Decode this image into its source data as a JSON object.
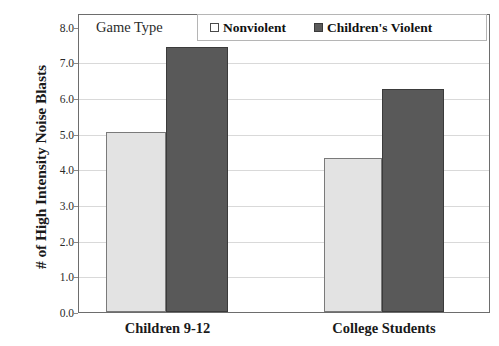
{
  "chart_data": {
    "type": "bar",
    "title": "",
    "xlabel": "",
    "ylabel": "# of High Intensity Noise Blasts",
    "categories": [
      "Children 9-12",
      "College Students"
    ],
    "series": [
      {
        "name": "Nonviolent",
        "values": [
          4.85,
          4.15
        ],
        "color": "#e3e3e3"
      },
      {
        "name": "Children's Violent",
        "values": [
          7.15,
          6.0
        ],
        "color": "#595959"
      }
    ],
    "ylim": [
      0.0,
      8.0
    ],
    "ytick_labels": [
      "8.0",
      "7.0",
      "6.0",
      "5.0",
      "4.0",
      "3.0",
      "2.0",
      "1.0",
      "0.0"
    ],
    "ytick_values": [
      8.0,
      7.0,
      6.0,
      5.0,
      4.0,
      3.0,
      2.0,
      1.0,
      0.0
    ],
    "grid": true,
    "legend_position": "top-inside",
    "legend_title": "Game Type"
  },
  "legend": {
    "title": "Game Type",
    "entries": [
      {
        "label": "Nonviolent",
        "swatch": "light-square-icon"
      },
      {
        "label": "Children's Violent",
        "swatch": "dark-square-icon"
      }
    ]
  },
  "axes": {
    "y_title": "# of High Intensity Noise Blasts",
    "y_ticks": [
      "8.0",
      "7.0",
      "6.0",
      "5.0",
      "4.0",
      "3.0",
      "2.0",
      "1.0",
      "0.0"
    ],
    "x_categories": [
      "Children 9-12",
      "College Students"
    ]
  }
}
